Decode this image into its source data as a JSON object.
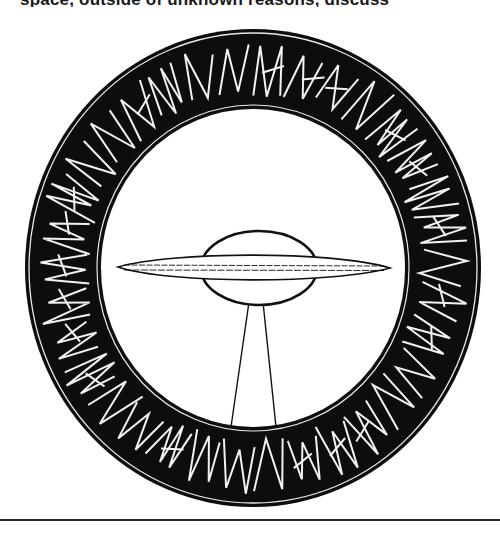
{
  "page": {
    "clipped_text": "space, outside of unknown reasons, discuss",
    "colors": {
      "ring": "#0d0d0d",
      "glyph": "#f2f2f2",
      "line": "#222222",
      "paper": "#ffffff"
    }
  },
  "emblem": {
    "center": [
      253,
      268
    ],
    "outer": {
      "rx": 228,
      "ry": 239
    },
    "inner": {
      "rx": 153,
      "ry": 160
    },
    "glyph_count": 34,
    "subject": "flying saucer with light beam"
  }
}
